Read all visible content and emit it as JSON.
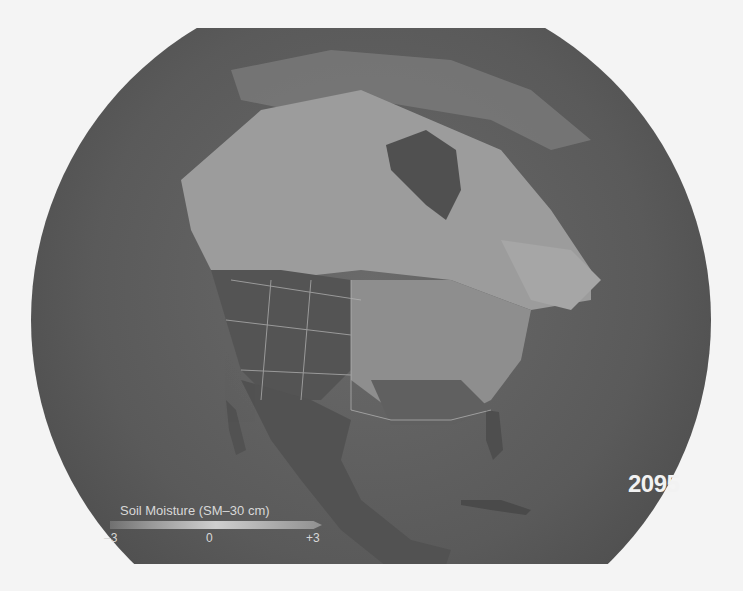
{
  "map": {
    "title": "Soil Moisture (SM-30 cm)",
    "region": "North America",
    "year": "2095",
    "legend": {
      "title": "Soil Moisture (SM–30 cm)",
      "min_label": "–3",
      "mid_label": "0",
      "max_label": "+3",
      "colors": {
        "dry": "#4a4a4a",
        "neutral": "#cfcfcf",
        "wet": "#909090"
      }
    }
  }
}
